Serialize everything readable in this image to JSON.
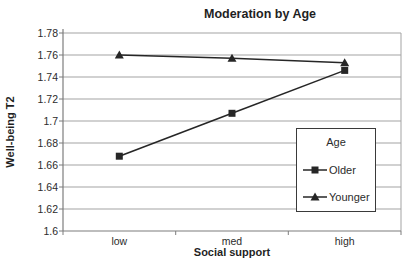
{
  "chart_data": {
    "type": "line",
    "title": "Moderation by Age",
    "xlabel": "Social support",
    "ylabel": "Well-being T2",
    "categories": [
      "low",
      "med",
      "high"
    ],
    "series": [
      {
        "name": "Older",
        "marker": "square",
        "values": [
          1.668,
          1.707,
          1.746
        ]
      },
      {
        "name": "Younger",
        "marker": "triangle",
        "values": [
          1.76,
          1.757,
          1.753
        ]
      }
    ],
    "ylim": [
      1.6,
      1.78
    ],
    "ytick_step": 0.02,
    "ytick_labels": [
      "1.78",
      "1.76",
      "1.74",
      "1.72",
      "1.7",
      "1.68",
      "1.66",
      "1.64",
      "1.62",
      "1.6"
    ],
    "grid": "horizontal",
    "legend": {
      "title": "Age",
      "position": "right-inside"
    },
    "colors": {
      "line": "#262626",
      "grid": "#a3a3a3",
      "axis": "#7d7d7d",
      "text": "#2b2b2b",
      "background": "#ffffff"
    }
  }
}
